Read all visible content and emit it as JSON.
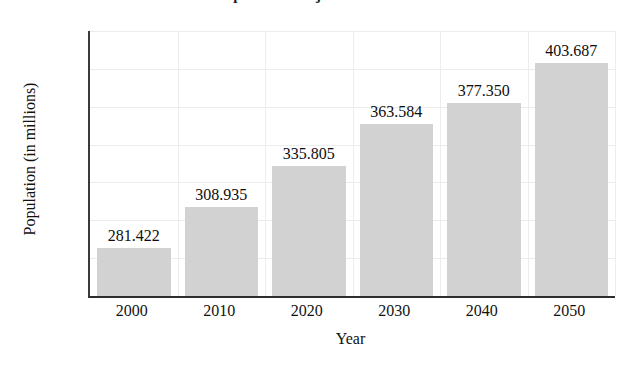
{
  "chart_data": {
    "type": "bar",
    "title": "U.S. Population Projections: 2000–2050",
    "xlabel": "Year",
    "ylabel": "Population (in millions)",
    "categories": [
      "2000",
      "2010",
      "2020",
      "2030",
      "2040",
      "2050"
    ],
    "values": [
      281.422,
      308.935,
      335.805,
      363.584,
      377.35,
      403.687
    ],
    "value_labels": [
      "281.422",
      "308.935",
      "335.805",
      "363.584",
      "377.350",
      "403.687"
    ],
    "ylim": [
      250,
      425
    ],
    "yticks": [
      250,
      275,
      300,
      325,
      350,
      375,
      400,
      425
    ],
    "ytick_labels": [
      "250",
      "275",
      "300",
      "325",
      "350",
      "375",
      "400",
      "425"
    ],
    "grid": true,
    "legend": null,
    "bar_color": "#d2d2d2",
    "axis_color": "#2e2e2e",
    "grid_color": "#ececec",
    "background": "#ffffff"
  }
}
